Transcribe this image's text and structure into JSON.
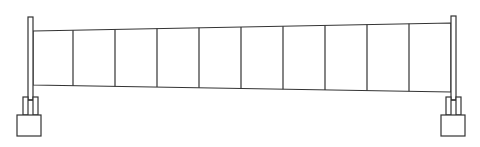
{
  "diagram": {
    "kind": "tapered-segmented-beam",
    "segment_count": 10,
    "stroke_color": "#333333",
    "background_color": "#ffffff",
    "supports": [
      {
        "name": "left-support",
        "type": "post-on-pedestal"
      },
      {
        "name": "right-support",
        "type": "post-on-pedestal"
      }
    ],
    "taper": "beam depth increases from left to right"
  }
}
